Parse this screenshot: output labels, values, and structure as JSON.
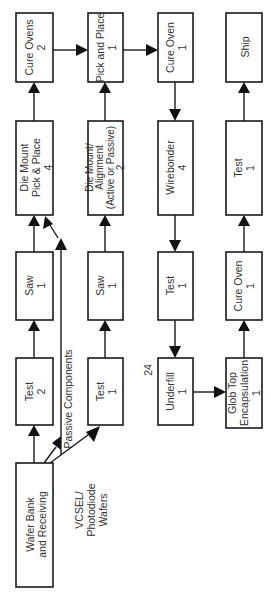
{
  "diagram": {
    "orientation": "rotated 90° counter-clockwise",
    "page_number": "24",
    "colors": {
      "stroke": "#1a1a1a",
      "text": "#333333",
      "background": "#ffffff"
    },
    "nodes": {
      "wafer_bank": {
        "line1": "Wafer Bank",
        "line2": "and Receiving",
        "line3": ""
      },
      "test_2": {
        "line1": "Test",
        "line2": "2",
        "line3": ""
      },
      "saw_a": {
        "line1": "Saw",
        "line2": "1",
        "line3": ""
      },
      "die_mount_pp": {
        "line1": "Die Mount",
        "line2": "Pick & Place",
        "line3": "4"
      },
      "cure_ovens": {
        "line1": "Cure Ovens",
        "line2": "2",
        "line3": ""
      },
      "test_1a": {
        "line1": "Test",
        "line2": "1",
        "line3": ""
      },
      "saw_b": {
        "line1": "Saw",
        "line2": "1",
        "line3": ""
      },
      "die_mount_align": {
        "line1": "Die Mount/",
        "line2": "Alignment",
        "line3": "(Active or Passive)",
        "line4": "2"
      },
      "pick_place": {
        "line1": "Pick and Place",
        "line2": "1",
        "line3": ""
      },
      "cure_oven_a": {
        "line1": "Cure Oven",
        "line2": "1",
        "line3": ""
      },
      "wirebonder": {
        "line1": "Wirebonder",
        "line2": "4",
        "line3": ""
      },
      "test_1b": {
        "line1": "Test",
        "line2": "1",
        "line3": ""
      },
      "underfill": {
        "line1": "Underfill",
        "line2": "1",
        "line3": ""
      },
      "glob_top": {
        "line1": "Glob Top",
        "line2": "Encapsulation",
        "line3": "1"
      },
      "cure_oven_b": {
        "line1": "Cure Oven",
        "line2": "1",
        "line3": ""
      },
      "test_1c": {
        "line1": "Test",
        "line2": "1",
        "line3": ""
      },
      "ship": {
        "line1": "Ship",
        "line2": "",
        "line3": ""
      }
    },
    "annotations": {
      "passive_components": "Passive Components",
      "vcsel_line1": "VCSEL/",
      "vcsel_line2": "Photodiode",
      "vcsel_line3": "Wafers"
    },
    "edges": [
      [
        "wafer_bank",
        "test_2"
      ],
      [
        "test_2",
        "saw_a"
      ],
      [
        "saw_a",
        "die_mount_pp"
      ],
      [
        "passive_components",
        "die_mount_pp"
      ],
      [
        "wafer_bank",
        "passive_components"
      ],
      [
        "die_mount_pp",
        "cure_ovens"
      ],
      [
        "cure_ovens",
        "pick_place"
      ],
      [
        "wafer_bank",
        "test_1a"
      ],
      [
        "test_1a",
        "saw_b"
      ],
      [
        "saw_b",
        "die_mount_align"
      ],
      [
        "die_mount_align",
        "pick_place"
      ],
      [
        "pick_place",
        "cure_oven_a"
      ],
      [
        "cure_oven_a",
        "wirebonder"
      ],
      [
        "wirebonder",
        "test_1b"
      ],
      [
        "test_1b",
        "underfill"
      ],
      [
        "underfill",
        "glob_top"
      ],
      [
        "glob_top",
        "cure_oven_b"
      ],
      [
        "cure_oven_b",
        "test_1c"
      ],
      [
        "test_1c",
        "ship"
      ]
    ]
  }
}
